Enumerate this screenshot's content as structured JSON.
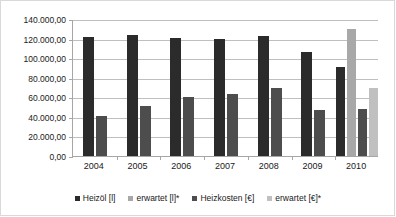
{
  "chart_data": {
    "type": "bar",
    "title": "",
    "subtitle": "",
    "xlabel": "",
    "ylabel": "",
    "categories": [
      "2004",
      "2005",
      "2006",
      "2007",
      "2008",
      "2009",
      "2010"
    ],
    "series": [
      {
        "name": "Heizöl [l]",
        "color": "#2b2b2b",
        "values": [
          122000,
          124000,
          121000,
          120000,
          123000,
          106500,
          90500
        ]
      },
      {
        "name": "erwartet [l]*",
        "color": "#a8a8a8",
        "values": [
          null,
          null,
          null,
          null,
          null,
          null,
          130000
        ]
      },
      {
        "name": "Heizkosten [€]",
        "color": "#4d4d4d",
        "values": [
          40500,
          51000,
          60000,
          63000,
          70000,
          47500,
          48500
        ]
      },
      {
        "name": "erwartet [€]*",
        "color": "#c0c0c0",
        "values": [
          null,
          null,
          null,
          null,
          null,
          null,
          69000
        ]
      }
    ],
    "ylim": [
      0,
      140000
    ],
    "ytick_step": 20000,
    "ytick_labels": [
      "140.000,00",
      "120.000,00",
      "100.000,00",
      "80.000,00",
      "60.000,00",
      "40.000,00",
      "20.000,00",
      "0,00"
    ],
    "ytick_values": [
      140000,
      120000,
      100000,
      80000,
      60000,
      40000,
      20000,
      0
    ],
    "grid": true,
    "legend_position": "bottom",
    "axis_color": "#a6a6a6",
    "grid_color": "#bfbfbf",
    "background": "#ffffff"
  }
}
